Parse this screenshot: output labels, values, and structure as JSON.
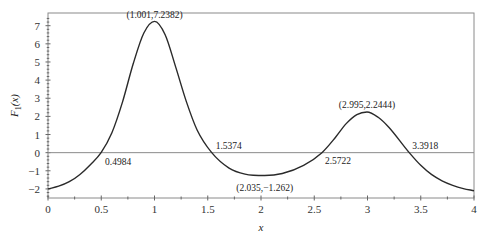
{
  "chart_data": {
    "type": "line",
    "title": "",
    "xlabel": "x",
    "ylabel": "F_1(x)",
    "ylabel_main": "F",
    "ylabel_sub": "1",
    "ylabel_arg": "(x)",
    "xlim": [
      0,
      4
    ],
    "ylim": [
      -2.5,
      7.7
    ],
    "grid": false,
    "legend": null,
    "x_ticks": [
      0,
      0.5,
      1,
      1.5,
      2,
      2.5,
      3,
      3.5,
      4
    ],
    "x_tick_labels": [
      "0",
      "0.5",
      "1",
      "1.5",
      "2",
      "2.5",
      "3",
      "3.5",
      "4"
    ],
    "y_ticks": [
      -2,
      -1,
      0,
      1,
      2,
      3,
      4,
      5,
      6,
      7
    ],
    "y_tick_labels": [
      "−2",
      "−1",
      "0",
      "1",
      "2",
      "3",
      "4",
      "5",
      "6",
      "7"
    ],
    "reference_line": {
      "y": 0
    },
    "series": [
      {
        "name": "F_1(x)",
        "x": [
          0,
          0.1,
          0.2,
          0.3,
          0.4,
          0.4984,
          0.6,
          0.7,
          0.8,
          0.9,
          1.001,
          1.1,
          1.2,
          1.3,
          1.4,
          1.5374,
          1.7,
          1.85,
          2.035,
          2.2,
          2.4,
          2.5722,
          2.7,
          2.8,
          2.9,
          2.995,
          3.1,
          3.2,
          3.3918,
          3.5,
          3.6,
          3.7,
          3.8,
          3.9,
          4.0
        ],
        "y": [
          -2.0,
          -1.85,
          -1.6,
          -1.2,
          -0.65,
          0.0,
          1.1,
          2.8,
          4.9,
          6.6,
          7.2382,
          6.5,
          4.7,
          2.8,
          1.25,
          0.0,
          -0.85,
          -1.18,
          -1.262,
          -1.15,
          -0.7,
          0.0,
          0.85,
          1.6,
          2.1,
          2.2444,
          1.95,
          1.4,
          0.0,
          -0.7,
          -1.2,
          -1.55,
          -1.8,
          -1.98,
          -2.1
        ]
      }
    ],
    "annotations": [
      {
        "text": "(1.001,7.2382)",
        "x": 1.001,
        "y": 7.2382
      },
      {
        "text": "0.4984",
        "x": 0.4984,
        "y": 0
      },
      {
        "text": "1.5374",
        "x": 1.5374,
        "y": 0
      },
      {
        "text": "(2.035,−1.262)",
        "x": 2.035,
        "y": -1.262
      },
      {
        "text": "2.5722",
        "x": 2.5722,
        "y": 0
      },
      {
        "text": "(2.995,2.2444)",
        "x": 2.995,
        "y": 2.2444
      },
      {
        "text": "3.3918",
        "x": 3.3918,
        "y": 0
      }
    ]
  }
}
